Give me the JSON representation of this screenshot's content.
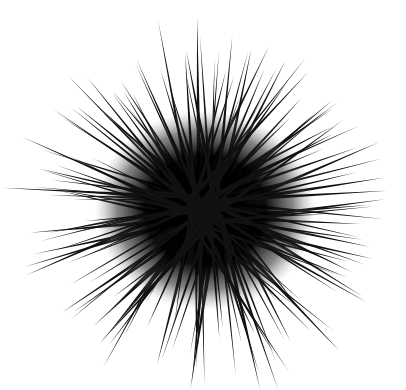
{
  "image": {
    "subject": "sea urchin",
    "description": "Black-and-white photograph of a spiny sea urchin viewed from above, long black spines radiating from a dark center on a white background",
    "background_color": "#ffffff",
    "body_color": "#000000",
    "spine_color": "#111111",
    "center": {
      "x": 205,
      "y": 210
    },
    "body_radius": 78,
    "spine_length_range": [
      120,
      185
    ],
    "spine_count": 150,
    "seed": 7
  }
}
